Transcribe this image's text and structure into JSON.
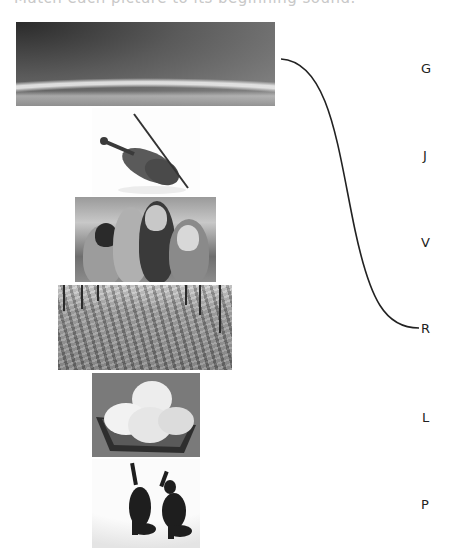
{
  "header": {
    "cut_text": "Match each picture to its beginning sound."
  },
  "pictures": [
    {
      "id": "rainbow",
      "label": "rainbow over grass field"
    },
    {
      "id": "violin",
      "label": "violin with bow"
    },
    {
      "id": "friends",
      "label": "group of four friends"
    },
    {
      "id": "field",
      "label": "crop field with vineyard posts"
    },
    {
      "id": "lemons",
      "label": "lemons in a dish"
    },
    {
      "id": "jump",
      "label": "two people jumping"
    }
  ],
  "letters": [
    "G",
    "J",
    "V",
    "R",
    "L",
    "P"
  ],
  "connections": [
    {
      "from_picture": "rainbow",
      "to_letter": "R"
    }
  ],
  "colors": {
    "line": "#222222",
    "text": "#222222"
  }
}
